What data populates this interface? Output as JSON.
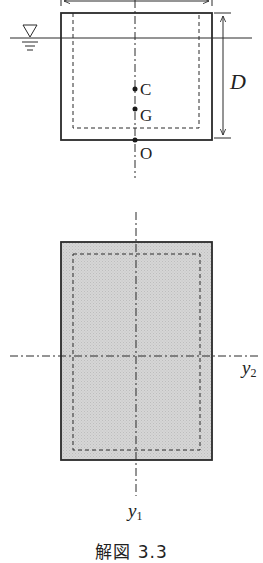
{
  "figure": {
    "caption": "解図 3.3",
    "colors": {
      "line": "#2a2a2a",
      "fill_plan": "#cfcfcf",
      "background": "#ffffff"
    }
  },
  "elevation_view": {
    "water_surface_symbol": "▽",
    "points": [
      {
        "label": "C"
      },
      {
        "label": "G"
      },
      {
        "label": "O"
      }
    ],
    "dimension_right": "D",
    "dimension_top": ""
  },
  "plan_view": {
    "axis_horizontal_label": "y",
    "axis_horizontal_sub": "2",
    "axis_vertical_label": "y",
    "axis_vertical_sub": "1"
  }
}
